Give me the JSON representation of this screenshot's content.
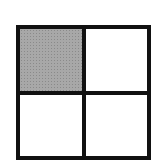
{
  "diagram": {
    "type": "grid",
    "rows": 2,
    "columns": 2,
    "border_color": "#111111",
    "shaded_color": "#a8a8a8",
    "cells": [
      {
        "row": 0,
        "col": 0,
        "shaded": true
      },
      {
        "row": 0,
        "col": 1,
        "shaded": false
      },
      {
        "row": 1,
        "col": 0,
        "shaded": false
      },
      {
        "row": 1,
        "col": 1,
        "shaded": false
      }
    ]
  }
}
